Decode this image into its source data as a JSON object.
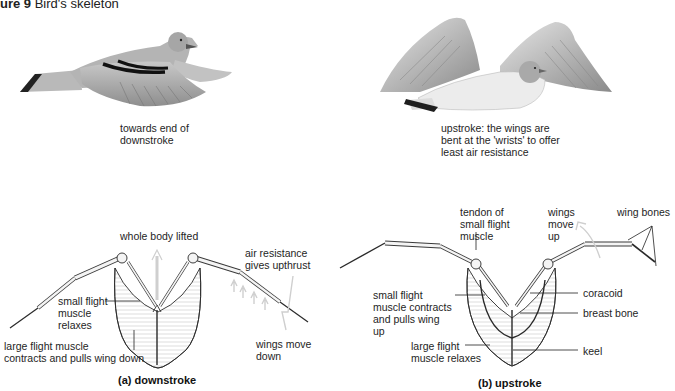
{
  "figure": {
    "number_label": "ure 9",
    "title": "Bird's skeleton"
  },
  "top_illustrations": {
    "downstroke_bird_caption": "towards end of\ndownstroke",
    "upstroke_bird_caption": "upstroke: the wings are\nbent at the 'wrists' to offer\nleast air resistance"
  },
  "downstroke_diagram": {
    "labels": {
      "whole_body_lifted": "whole body lifted",
      "air_resistance": "air resistance\ngives upthrust",
      "small_flight_muscle": "small flight\nmuscle\nrelaxes",
      "large_flight_muscle": "large flight muscle\ncontracts and pulls wing down",
      "wings_move_down": "wings move\ndown"
    },
    "caption": "(a)  downstroke"
  },
  "upstroke_diagram": {
    "labels": {
      "tendon": "tendon of\nsmall flight\nmuscle",
      "wings_move_up": "wings\nmove\nup",
      "wing_bones": "wing bones",
      "small_flight_muscle": "small flight\nmuscle contracts\nand pulls wing\nup",
      "large_flight_muscle": "large flight\nmuscle relaxes",
      "coracoid": "coracoid",
      "breast_bone": "breast bone",
      "keel": "keel"
    },
    "caption": "(b)  upstroke"
  },
  "colors": {
    "ink": "#1e1e1e",
    "feather_grey": "#a8a8a8",
    "muscle_shade": "#d9d9d9",
    "arrow_grey": "#cfcfcf"
  }
}
